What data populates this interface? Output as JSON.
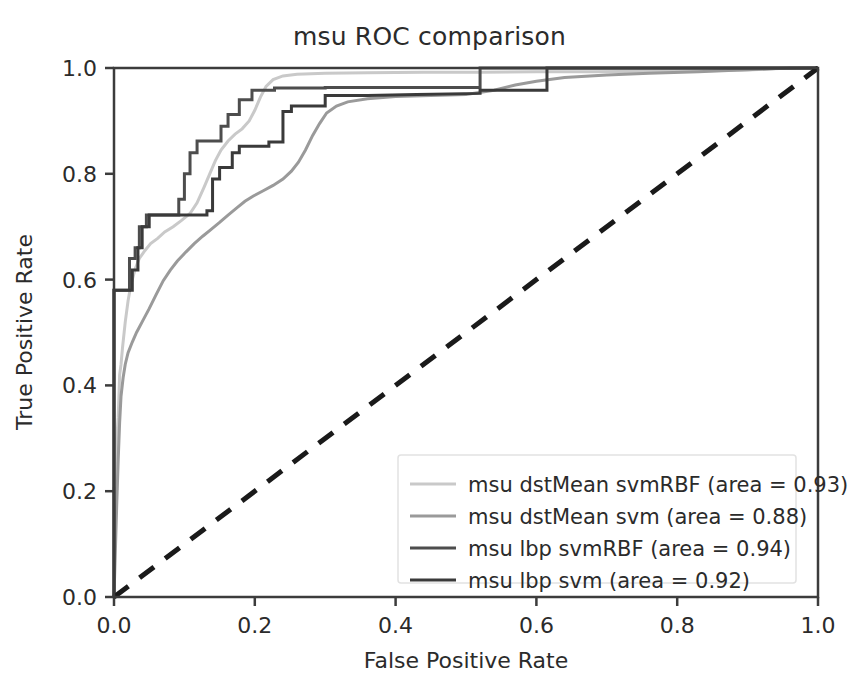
{
  "chart_data": {
    "type": "line",
    "title": "msu ROC comparison",
    "xlabel": "False Positive Rate",
    "ylabel": "True Positive Rate",
    "xlim": [
      0.0,
      1.0
    ],
    "ylim": [
      0.0,
      1.0
    ],
    "xticks": [
      "0.0",
      "0.2",
      "0.4",
      "0.6",
      "0.8",
      "1.0"
    ],
    "yticks": [
      "0.0",
      "0.2",
      "0.4",
      "0.6",
      "0.8",
      "1.0"
    ],
    "xtick_values": [
      0.0,
      0.2,
      0.4,
      0.6,
      0.8,
      1.0
    ],
    "ytick_values": [
      0.0,
      0.2,
      0.4,
      0.6,
      0.8,
      1.0
    ],
    "grid": false,
    "legend_position": "lower right",
    "series": [
      {
        "name": "msu dstMean svmRBF (area = 0.93)",
        "short_name": "msu dstMean svmRBF",
        "area": 0.93,
        "color": "#c9c9c9",
        "linewidth": 3,
        "linestyle": "solid",
        "points": [
          [
            0.0,
            0.0
          ],
          [
            0.0,
            0.205
          ],
          [
            0.004,
            0.205
          ],
          [
            0.004,
            0.3
          ],
          [
            0.006,
            0.34
          ],
          [
            0.008,
            0.42
          ],
          [
            0.01,
            0.44
          ],
          [
            0.012,
            0.47
          ],
          [
            0.016,
            0.52
          ],
          [
            0.02,
            0.56
          ],
          [
            0.024,
            0.59
          ],
          [
            0.03,
            0.62
          ],
          [
            0.036,
            0.64
          ],
          [
            0.044,
            0.655
          ],
          [
            0.052,
            0.668
          ],
          [
            0.062,
            0.678
          ],
          [
            0.072,
            0.69
          ],
          [
            0.084,
            0.7
          ],
          [
            0.096,
            0.712
          ],
          [
            0.108,
            0.725
          ],
          [
            0.118,
            0.745
          ],
          [
            0.128,
            0.775
          ],
          [
            0.136,
            0.8
          ],
          [
            0.144,
            0.825
          ],
          [
            0.152,
            0.845
          ],
          [
            0.162,
            0.862
          ],
          [
            0.172,
            0.875
          ],
          [
            0.182,
            0.885
          ],
          [
            0.192,
            0.9
          ],
          [
            0.2,
            0.92
          ],
          [
            0.208,
            0.945
          ],
          [
            0.216,
            0.965
          ],
          [
            0.226,
            0.978
          ],
          [
            0.24,
            0.985
          ],
          [
            0.26,
            0.988
          ],
          [
            0.3,
            0.99
          ],
          [
            0.36,
            0.991
          ],
          [
            0.44,
            0.992
          ],
          [
            0.52,
            0.992
          ],
          [
            0.6,
            0.993
          ],
          [
            0.68,
            0.993
          ],
          [
            0.76,
            0.994
          ],
          [
            0.84,
            0.995
          ],
          [
            0.9,
            0.996
          ],
          [
            0.93,
            0.998
          ],
          [
            0.96,
            1.0
          ],
          [
            1.0,
            1.0
          ]
        ]
      },
      {
        "name": "msu dstMean svm (area = 0.88)",
        "short_name": "msu dstMean svm",
        "area": 0.88,
        "color": "#9a9a9a",
        "linewidth": 3,
        "linestyle": "solid",
        "points": [
          [
            0.0,
            0.0
          ],
          [
            0.002,
            0.09
          ],
          [
            0.004,
            0.18
          ],
          [
            0.006,
            0.26
          ],
          [
            0.008,
            0.33
          ],
          [
            0.01,
            0.38
          ],
          [
            0.013,
            0.415
          ],
          [
            0.016,
            0.44
          ],
          [
            0.02,
            0.462
          ],
          [
            0.026,
            0.482
          ],
          [
            0.032,
            0.5
          ],
          [
            0.04,
            0.52
          ],
          [
            0.05,
            0.545
          ],
          [
            0.06,
            0.572
          ],
          [
            0.07,
            0.598
          ],
          [
            0.08,
            0.618
          ],
          [
            0.09,
            0.635
          ],
          [
            0.102,
            0.652
          ],
          [
            0.114,
            0.668
          ],
          [
            0.126,
            0.682
          ],
          [
            0.138,
            0.695
          ],
          [
            0.15,
            0.708
          ],
          [
            0.162,
            0.722
          ],
          [
            0.174,
            0.735
          ],
          [
            0.186,
            0.748
          ],
          [
            0.198,
            0.758
          ],
          [
            0.212,
            0.768
          ],
          [
            0.226,
            0.778
          ],
          [
            0.24,
            0.79
          ],
          [
            0.252,
            0.805
          ],
          [
            0.262,
            0.822
          ],
          [
            0.272,
            0.845
          ],
          [
            0.282,
            0.872
          ],
          [
            0.292,
            0.895
          ],
          [
            0.302,
            0.915
          ],
          [
            0.316,
            0.928
          ],
          [
            0.332,
            0.936
          ],
          [
            0.36,
            0.942
          ],
          [
            0.4,
            0.946
          ],
          [
            0.45,
            0.948
          ],
          [
            0.5,
            0.95
          ],
          [
            0.54,
            0.958
          ],
          [
            0.57,
            0.968
          ],
          [
            0.6,
            0.975
          ],
          [
            0.64,
            0.982
          ],
          [
            0.7,
            0.987
          ],
          [
            0.76,
            0.99
          ],
          [
            0.83,
            0.993
          ],
          [
            0.89,
            0.996
          ],
          [
            0.94,
            0.999
          ],
          [
            1.0,
            1.0
          ]
        ]
      },
      {
        "name": "msu lbp svmRBF (area = 0.94)",
        "short_name": "msu lbp svmRBF",
        "area": 0.94,
        "color": "#4d4d4d",
        "linewidth": 3,
        "linestyle": "solid",
        "points": [
          [
            0.0,
            0.0
          ],
          [
            0.0,
            0.58
          ],
          [
            0.022,
            0.58
          ],
          [
            0.022,
            0.64
          ],
          [
            0.03,
            0.64
          ],
          [
            0.03,
            0.66
          ],
          [
            0.036,
            0.66
          ],
          [
            0.036,
            0.7
          ],
          [
            0.046,
            0.7
          ],
          [
            0.046,
            0.722
          ],
          [
            0.092,
            0.722
          ],
          [
            0.092,
            0.752
          ],
          [
            0.1,
            0.752
          ],
          [
            0.1,
            0.8
          ],
          [
            0.108,
            0.8
          ],
          [
            0.108,
            0.84
          ],
          [
            0.118,
            0.84
          ],
          [
            0.118,
            0.862
          ],
          [
            0.152,
            0.862
          ],
          [
            0.152,
            0.89
          ],
          [
            0.162,
            0.89
          ],
          [
            0.162,
            0.912
          ],
          [
            0.178,
            0.912
          ],
          [
            0.178,
            0.94
          ],
          [
            0.196,
            0.94
          ],
          [
            0.196,
            0.958
          ],
          [
            0.228,
            0.958
          ],
          [
            0.228,
            0.962
          ],
          [
            0.3,
            0.962
          ],
          [
            0.3,
            0.963
          ],
          [
            0.43,
            0.963
          ],
          [
            0.52,
            0.963
          ],
          [
            0.52,
            1.0
          ],
          [
            0.615,
            1.0
          ],
          [
            1.0,
            1.0
          ]
        ]
      },
      {
        "name": "msu lbp svm (area = 0.92)",
        "short_name": "msu lbp svm",
        "area": 0.92,
        "color": "#3a3a3a",
        "linewidth": 3,
        "linestyle": "solid",
        "points": [
          [
            0.0,
            0.0
          ],
          [
            0.0,
            0.58
          ],
          [
            0.026,
            0.58
          ],
          [
            0.026,
            0.618
          ],
          [
            0.034,
            0.618
          ],
          [
            0.034,
            0.66
          ],
          [
            0.04,
            0.66
          ],
          [
            0.04,
            0.7
          ],
          [
            0.05,
            0.7
          ],
          [
            0.05,
            0.722
          ],
          [
            0.132,
            0.722
          ],
          [
            0.132,
            0.73
          ],
          [
            0.14,
            0.73
          ],
          [
            0.14,
            0.79
          ],
          [
            0.15,
            0.79
          ],
          [
            0.15,
            0.812
          ],
          [
            0.168,
            0.812
          ],
          [
            0.168,
            0.84
          ],
          [
            0.178,
            0.84
          ],
          [
            0.178,
            0.852
          ],
          [
            0.22,
            0.852
          ],
          [
            0.22,
            0.86
          ],
          [
            0.24,
            0.86
          ],
          [
            0.24,
            0.918
          ],
          [
            0.252,
            0.918
          ],
          [
            0.252,
            0.928
          ],
          [
            0.3,
            0.928
          ],
          [
            0.3,
            0.948
          ],
          [
            0.36,
            0.948
          ],
          [
            0.43,
            0.95
          ],
          [
            0.52,
            0.952
          ],
          [
            0.52,
            0.958
          ],
          [
            0.615,
            0.958
          ],
          [
            0.615,
            1.0
          ],
          [
            0.7,
            1.0
          ],
          [
            1.0,
            1.0
          ]
        ]
      }
    ],
    "reference_line": {
      "name": "chance-diagonal",
      "color": "#1a1a1a",
      "linestyle": "dashed",
      "linewidth": 5,
      "points": [
        [
          0.0,
          0.0
        ],
        [
          1.0,
          1.0
        ]
      ]
    }
  },
  "legend": {
    "entries": [
      "msu dstMean svmRBF (area = 0.93)",
      "msu dstMean svm (area = 0.88)",
      "msu lbp svmRBF (area = 0.94)",
      "msu lbp svm (area = 0.92)"
    ]
  }
}
